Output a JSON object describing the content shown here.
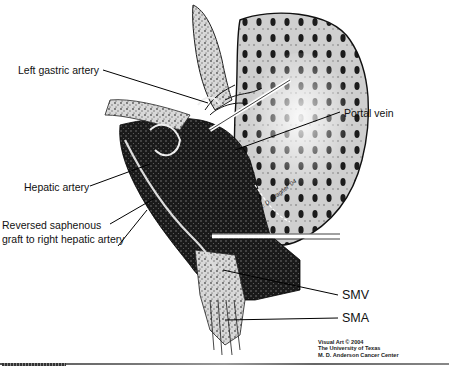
{
  "figure": {
    "type": "anatomical-illustration",
    "labels": {
      "left_gastric_artery": "Left gastric artery",
      "hepatic_artery": "Hepatic artery",
      "reversed_saphenous_line1": "Reversed saphenous",
      "reversed_saphenous_line2": "graft to right hepatic artery",
      "portal_vein": "Portal vein",
      "smv": "SMV",
      "sma": "SMA"
    },
    "signature": "K. D. Wagner '04",
    "credit": {
      "line1": "Visual Art © 2004",
      "line2": "The University of Texas",
      "line3": "M. D. Anderson Cancer Center"
    }
  }
}
